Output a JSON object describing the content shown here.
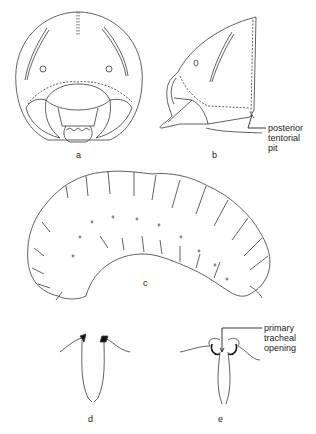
{
  "figure": {
    "panels": [
      {
        "id": "a",
        "label": "a",
        "description": "head, frontal view"
      },
      {
        "id": "b",
        "label": "b",
        "description": "head, lateral view"
      },
      {
        "id": "c",
        "label": "c",
        "description": "larva, lateral view (C-shaped grub)"
      },
      {
        "id": "d",
        "label": "d",
        "description": "spiracle detail"
      },
      {
        "id": "e",
        "label": "e",
        "description": "spiracle detail with primary tracheal opening"
      }
    ],
    "callouts": {
      "b": [
        "posterior",
        "tentorial",
        "pit"
      ],
      "e": [
        "primary",
        "tracheal",
        "opening"
      ]
    }
  },
  "colors": {
    "line": "#3a3a3a",
    "background": "#ffffff",
    "spiracle_fill": "#111111"
  }
}
